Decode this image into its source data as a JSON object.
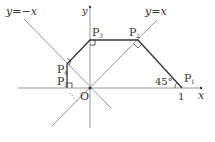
{
  "diagram": {
    "axes": {
      "x_label": "x",
      "y_label": "y",
      "origin_label": "O",
      "tick_label_1": "1"
    },
    "lines": {
      "y_eq_x": "y=x",
      "y_eq_neg_x": "y=−x"
    },
    "points": [
      {
        "name": "P1",
        "main": "P",
        "sub": "1"
      },
      {
        "name": "P2",
        "main": "P",
        "sub": "2"
      },
      {
        "name": "P3",
        "main": "P",
        "sub": "3"
      },
      {
        "name": "P4",
        "main": "P",
        "sub": "4"
      },
      {
        "name": "P5",
        "main": "P",
        "sub": "5"
      }
    ],
    "angle_label": "45°",
    "colors": {
      "axis": "#9a9a9a",
      "guide_line": "#8a8a8a",
      "path": "#333333",
      "text": "#333333"
    }
  }
}
